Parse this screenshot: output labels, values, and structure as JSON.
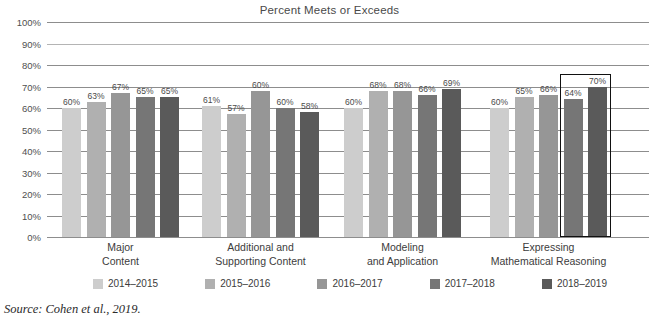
{
  "chart_data": {
    "type": "bar",
    "title": "Percent Meets or Exceeds",
    "title_clipped": "Mathematics Performance",
    "xlabel": "",
    "ylabel": "",
    "ylim": [
      0,
      100
    ],
    "grid": true,
    "legend_position": "bottom",
    "categories": [
      "Major\nContent",
      "Additional and\nSupporting Content",
      "Modeling\nand Application",
      "Expressing\nMathematical Reasoning"
    ],
    "category_lines": [
      [
        "Major",
        "Content"
      ],
      [
        "Additional and",
        "Supporting Content"
      ],
      [
        "Modeling",
        "and Application"
      ],
      [
        "Expressing",
        "Mathematical Reasoning"
      ]
    ],
    "series": [
      {
        "name": "2014–2015",
        "color": "#cdcdcd",
        "values": [
          60,
          61,
          60,
          60
        ]
      },
      {
        "name": "2015–2016",
        "color": "#b0b0b0",
        "values": [
          63,
          57,
          68,
          65
        ]
      },
      {
        "name": "2016–2017",
        "color": "#969696",
        "values": [
          67,
          68,
          68,
          66
        ]
      },
      {
        "name": "2017–2018",
        "color": "#767676",
        "values": [
          65,
          60,
          66,
          64
        ]
      },
      {
        "name": "2018–2019",
        "color": "#5a5a5a",
        "values": [
          65,
          58,
          69,
          70
        ]
      }
    ],
    "value_labels": [
      [
        "60%",
        "63%",
        "67%",
        "65%",
        "65%"
      ],
      [
        "61%",
        "57%",
        "60%",
        "60%",
        "58%"
      ],
      [
        "60%",
        "68%",
        "68%",
        "66%",
        "69%"
      ],
      [
        "60%",
        "65%",
        "66%",
        "64%",
        "70%"
      ]
    ],
    "ytick_labels": [
      "100%",
      "90%",
      "80%",
      "70%",
      "60%",
      "50%",
      "40%",
      "30%",
      "20%",
      "10%",
      "0%"
    ],
    "ytick_values": [
      100,
      90,
      80,
      70,
      60,
      50,
      40,
      30,
      20,
      10,
      0
    ],
    "annotation": {
      "type": "highlight-box",
      "label": "highlight around 2017–2018 and 2018–2019 bars of Expressing Mathematical Reasoning",
      "group_index": 3,
      "series_indices": [
        3,
        4
      ],
      "color": "#111111"
    }
  },
  "source": {
    "text": "Source: Cohen et al., 2019."
  }
}
